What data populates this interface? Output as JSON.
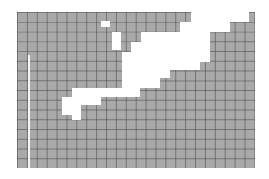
{
  "figure": {
    "grid": {
      "origin_px": [
        17,
        12
      ],
      "extent_px": [
        255,
        168
      ],
      "cell_size_px": [
        9.9,
        9.75
      ],
      "columns": 24,
      "rows": 16,
      "fill_color": "#a9a9a9",
      "line_color": "#5a5a5a",
      "background": "#ffffff"
    },
    "gray_regions": [
      {
        "name": "top-band-row0",
        "x": 17,
        "y": 12,
        "w": 174,
        "h": 10
      },
      {
        "name": "top-band-row1",
        "x": 17,
        "y": 22,
        "w": 163,
        "h": 10
      },
      {
        "name": "left-band-a",
        "x": 17,
        "y": 32,
        "w": 124,
        "h": 10
      },
      {
        "name": "left-band-b",
        "x": 17,
        "y": 42,
        "w": 114,
        "h": 10
      },
      {
        "name": "left-band-c",
        "x": 17,
        "y": 52,
        "w": 105,
        "h": 36
      },
      {
        "name": "left-band-d",
        "x": 17,
        "y": 88,
        "w": 55,
        "h": 9
      },
      {
        "name": "left-band-e",
        "x": 17,
        "y": 97,
        "w": 45,
        "h": 18
      },
      {
        "name": "left-band-f",
        "x": 17,
        "y": 115,
        "w": 55,
        "h": 5
      },
      {
        "name": "right-cap",
        "x": 249,
        "y": 12,
        "w": 6,
        "h": 10
      },
      {
        "name": "right-a",
        "x": 230,
        "y": 22,
        "w": 25,
        "h": 10
      },
      {
        "name": "right-b",
        "x": 210,
        "y": 32,
        "w": 45,
        "h": 30
      },
      {
        "name": "right-c",
        "x": 200,
        "y": 62,
        "w": 55,
        "h": 8
      },
      {
        "name": "right-d",
        "x": 170,
        "y": 70,
        "w": 85,
        "h": 8
      },
      {
        "name": "right-e",
        "x": 160,
        "y": 78,
        "w": 95,
        "h": 10
      },
      {
        "name": "right-f",
        "x": 140,
        "y": 88,
        "w": 115,
        "h": 9
      },
      {
        "name": "right-g",
        "x": 101,
        "y": 97,
        "w": 154,
        "h": 8
      },
      {
        "name": "right-h",
        "x": 81,
        "y": 105,
        "w": 174,
        "h": 15
      },
      {
        "name": "bottom-band",
        "x": 17,
        "y": 120,
        "w": 238,
        "h": 48
      }
    ],
    "holes": [
      {
        "name": "small-hole",
        "x": 101,
        "y": 21,
        "w": 9,
        "h": 6
      },
      {
        "name": "tall-hole",
        "x": 112,
        "y": 32,
        "w": 9,
        "h": 18
      }
    ],
    "vertical_line": {
      "x": 28,
      "y": 55,
      "w": 2,
      "h": 113,
      "color": "#f4f4f4"
    }
  }
}
